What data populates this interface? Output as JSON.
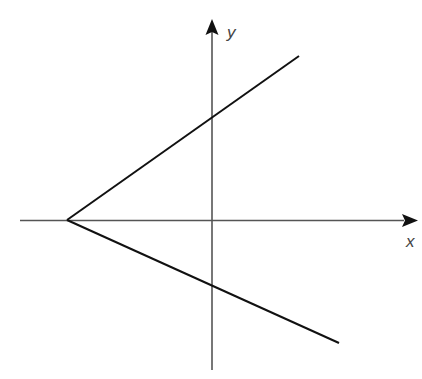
{
  "diagram": {
    "axes": {
      "x_label": "x",
      "y_label": "y",
      "color": "#555555"
    },
    "lines": [
      {
        "name": "upper-line",
        "from": [
          67,
          220
        ],
        "to": [
          299,
          56
        ],
        "crosses_y_axis_at": [
          212,
          117
        ]
      },
      {
        "name": "lower-line",
        "from": [
          67,
          220
        ],
        "to": [
          339,
          343
        ],
        "crosses_y_axis_at": [
          212,
          287
        ]
      }
    ],
    "vertex": [
      67,
      220
    ],
    "line_color": "#111111"
  }
}
